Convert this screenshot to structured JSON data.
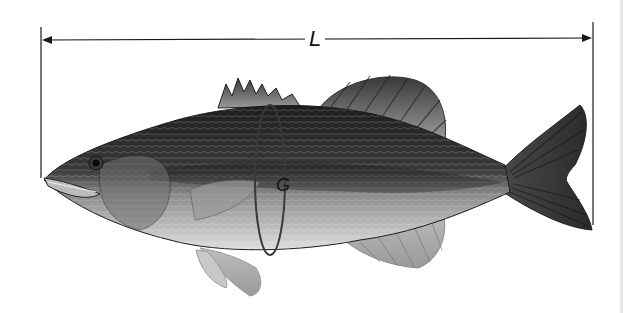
{
  "figure": {
    "measurements": {
      "length_label": "L",
      "girth_label": "G"
    }
  },
  "colors": {
    "line": "#1a1a1a",
    "body_dark": "#2b2b2b",
    "body_light": "#cfcfcf",
    "fin": "#8a8a8a"
  }
}
